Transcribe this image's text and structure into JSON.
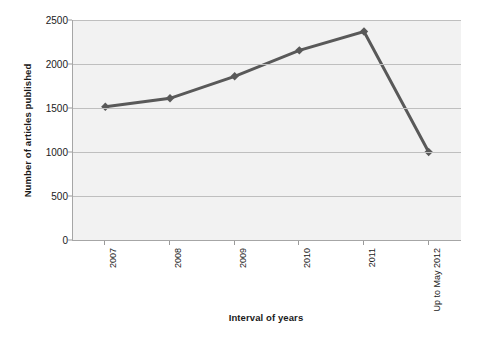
{
  "chart_data": {
    "type": "line",
    "title": "",
    "xlabel": "Interval of years",
    "ylabel": "Number of articles published",
    "categories": [
      "2007",
      "2008",
      "2009",
      "2010",
      "2011",
      "Up to May 2012"
    ],
    "values": [
      1515,
      1610,
      1860,
      2155,
      2370,
      1000
    ],
    "ylim": [
      0,
      2500
    ],
    "yticks": [
      0,
      500,
      1000,
      1500,
      2000,
      2500
    ],
    "ytick_labels": [
      "0",
      "500",
      "1000",
      "1500",
      "2000",
      "2500"
    ],
    "grid": true,
    "legend": false,
    "series": [
      {
        "name": "Number of articles published",
        "values": [
          1515,
          1610,
          1860,
          2155,
          2370,
          1000
        ],
        "color": "#595959",
        "marker": "diamond"
      }
    ],
    "colors": {
      "line": "#595959",
      "marker": "#595959",
      "plot_background": "#f2f2f2",
      "gridline": "#bfbfbf",
      "axis": "#a6a6a6",
      "text": "#1a1a1a",
      "page_background": "#ffffff"
    }
  }
}
